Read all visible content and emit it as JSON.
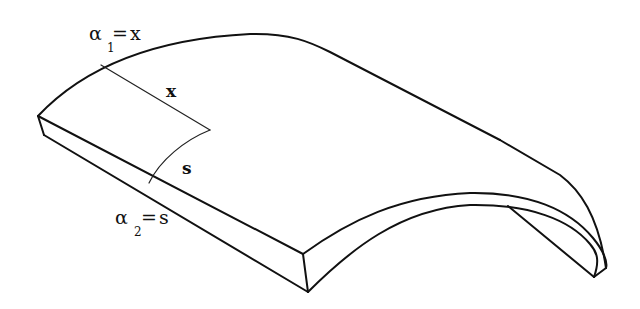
{
  "figure": {
    "line_color": "#111111",
    "background": "#ffffff"
  },
  "labels": {
    "alpha1": {
      "symbol": "α",
      "subscript": "1",
      "equals": "=",
      "value": "x"
    },
    "alpha2": {
      "symbol": "α",
      "subscript": "2",
      "equals": "=",
      "value": "s"
    },
    "x_coord": "x",
    "s_coord": "s"
  }
}
